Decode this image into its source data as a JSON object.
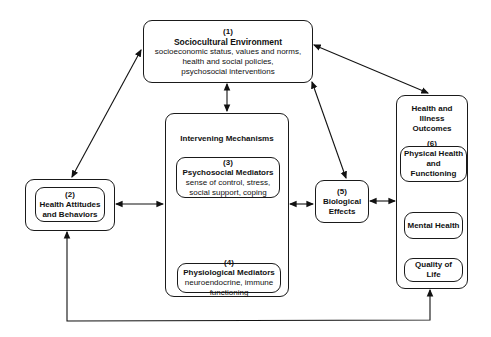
{
  "diagram": {
    "sociocultural": {
      "number": "(1)",
      "title": "Sociocultural Environment",
      "lines": [
        "socioeconomic status, values and norms,",
        "health and social policies,",
        "psychosocial interventions"
      ]
    },
    "health_attitudes": {
      "number": "(2)",
      "title_line1": "Health Attitudes",
      "title_line2": "and Behaviors"
    },
    "intervening": {
      "title": "Intervening Mechanisms",
      "psychosocial": {
        "number": "(3)",
        "title": "Psychosocial Mediators",
        "lines": [
          "sense of control, stress,",
          "social support, coping"
        ]
      },
      "physiological": {
        "number": "(4)",
        "title": "Physiological Mediators",
        "lines": [
          "neuroendocrine, immune",
          "functioning"
        ]
      }
    },
    "biological": {
      "number": "(5)",
      "title_line1": "Biological",
      "title_line2": "Effects"
    },
    "outcomes": {
      "title_lines": [
        "Health and",
        "Illness",
        "Outcomes"
      ],
      "number": "(6)",
      "physical": [
        "Physical Health",
        "and",
        "Functioning"
      ],
      "mental": "Mental Health",
      "quality": [
        "Quality of",
        "Life"
      ]
    }
  }
}
